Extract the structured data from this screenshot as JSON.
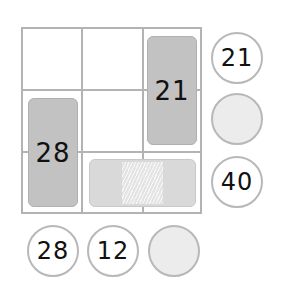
{
  "puzzle": {
    "grid": {
      "rows": 3,
      "cols": 3,
      "line_color": "#b3b3b3"
    },
    "pieces": [
      {
        "id": "tall-right",
        "label": "21",
        "orientation": "vertical",
        "cells": "col3 rows1-2",
        "fill": "#c2c2c2"
      },
      {
        "id": "tall-left",
        "label": "28",
        "orientation": "vertical",
        "cells": "col1 rows2-3",
        "fill": "#c2c2c2"
      },
      {
        "id": "wide-bottom",
        "label": "",
        "orientation": "horizontal",
        "cells": "row3 cols2-3",
        "fill": "#d9d9d9",
        "hatched_center": true
      }
    ],
    "row_clues": [
      {
        "value": "21",
        "hatched": false
      },
      {
        "value": "",
        "hatched": true
      },
      {
        "value": "40",
        "hatched": false
      }
    ],
    "column_clues": [
      {
        "value": "28",
        "hatched": false
      },
      {
        "value": "12",
        "hatched": false
      },
      {
        "value": "",
        "hatched": true
      }
    ]
  }
}
